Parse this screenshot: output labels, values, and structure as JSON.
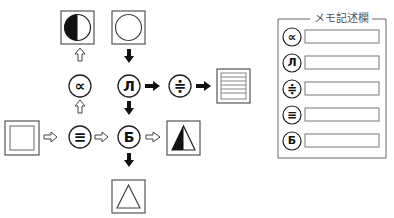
{
  "diagram": {
    "start_box": {
      "shape": "double-square"
    },
    "operators": [
      {
        "id": "equiv",
        "symbol": "≡",
        "name": "triple-bar"
      },
      {
        "id": "prop",
        "symbol": "∝",
        "name": "proportional"
      },
      {
        "id": "el",
        "symbol": "Л",
        "name": "cyrillic-el"
      },
      {
        "id": "approx",
        "symbol": "≑",
        "name": "approx-equal"
      },
      {
        "id": "be",
        "symbol": "Б",
        "name": "cyrillic-be"
      }
    ],
    "result_boxes": [
      {
        "id": "half-circle",
        "shape": "circle-left-half-filled"
      },
      {
        "id": "circle",
        "shape": "circle"
      },
      {
        "id": "lines",
        "shape": "horizontal-lines-square"
      },
      {
        "id": "half-triangle",
        "shape": "triangle-left-half-filled"
      },
      {
        "id": "triangle",
        "shape": "triangle"
      }
    ],
    "arrows": {
      "hollow": [
        "start->≡",
        "≡->∝",
        "∝->half-circle",
        "≡->Б",
        "Б->half-triangle"
      ],
      "solid": [
        "circle->Л",
        "Л->≑",
        "≑->lines",
        "Л->Б",
        "Б->triangle"
      ]
    }
  },
  "memo": {
    "title": "メモ記述欄",
    "rows": [
      {
        "symbol": "∝",
        "value": ""
      },
      {
        "symbol": "Л",
        "value": ""
      },
      {
        "symbol": "≑",
        "value": ""
      },
      {
        "symbol": "≡",
        "value": ""
      },
      {
        "symbol": "Б",
        "value": ""
      }
    ]
  }
}
